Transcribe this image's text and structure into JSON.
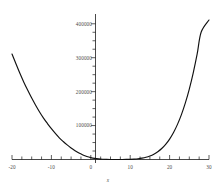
{
  "chart_data": {
    "type": "line",
    "title": "",
    "subtitle": "",
    "xlabel": "x",
    "ylabel": "",
    "xlim": [
      -20,
      30
    ],
    "ylim": [
      0,
      420000
    ],
    "grid": false,
    "legend": null,
    "x_ticks": [
      -20,
      -10,
      0,
      10,
      20,
      30
    ],
    "x_tick_labels": [
      "-20",
      "-10",
      "0",
      "10",
      "20",
      "30"
    ],
    "x_minor_tick_step": 2.5,
    "y_ticks": [
      100000,
      200000,
      300000,
      400000
    ],
    "y_tick_labels": [
      "100000",
      "200000",
      "300000",
      "400000"
    ],
    "y_minor_tick_step": 25000,
    "series": [
      {
        "name": "curve",
        "color": "#111111",
        "x": [
          -20,
          -19,
          -18,
          -17,
          -16,
          -15,
          -14,
          -13,
          -12,
          -11,
          -10,
          -9,
          -8,
          -7,
          -6,
          -5,
          -4,
          -3,
          -2,
          -1,
          0,
          1,
          2,
          3,
          4,
          5,
          6,
          7,
          8,
          9,
          10,
          11,
          12,
          13,
          14,
          15,
          16,
          17,
          18,
          19,
          20,
          21,
          22,
          23,
          24,
          25,
          26,
          27,
          28,
          29,
          30
        ],
        "y": [
          311000,
          282000,
          254000,
          228000,
          204000,
          181000,
          160000,
          140000,
          122000,
          106000,
          91000,
          77000,
          64000,
          53000,
          43000,
          34000,
          26000,
          19000,
          13500,
          9000,
          5600,
          3200,
          1700,
          800,
          320,
          100,
          30,
          20,
          60,
          200,
          500,
          1100,
          2200,
          3900,
          6500,
          10300,
          15600,
          22800,
          32300,
          44600,
          60200,
          79600,
          103500,
          132300,
          166700,
          207500,
          255400,
          311000,
          375000,
          448000,
          411000
        ]
      }
    ]
  },
  "axes": {
    "x_axis_name": "x-axis",
    "y_axis_name": "y-axis",
    "x_title": "x"
  }
}
